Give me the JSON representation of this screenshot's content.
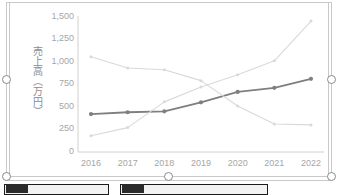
{
  "chart_data": {
    "type": "line",
    "title": "",
    "xlabel": "",
    "ylabel": "売上高（万円）",
    "categories": [
      "2016",
      "2017",
      "2018",
      "2019",
      "2020",
      "2021",
      "2022"
    ],
    "ylim": [
      0,
      1500
    ],
    "yticks": [
      0,
      250,
      500,
      750,
      1000,
      1250,
      1500
    ],
    "ytick_labels": [
      "0",
      "250",
      "500",
      "750",
      "1,000",
      "1,250",
      "1,500"
    ],
    "grid": false,
    "legend_position": "none",
    "series": [
      {
        "name": "series-dark",
        "color": "#7f7f7f",
        "marker": "circle",
        "values": [
          420,
          440,
          450,
          550,
          665,
          710,
          810
        ]
      },
      {
        "name": "series-light-rising",
        "color": "#d9d9d9",
        "marker": "circle",
        "values": [
          180,
          270,
          555,
          720,
          855,
          1010,
          1450
        ]
      },
      {
        "name": "series-light-declining",
        "color": "#d9d9d9",
        "marker": "circle",
        "values": [
          1055,
          930,
          910,
          790,
          510,
          310,
          300
        ]
      }
    ]
  },
  "selection": {
    "handles": [
      "left-middle",
      "right-middle",
      "bottom-left",
      "bottom-center",
      "bottom-right"
    ]
  },
  "bottom_bar": {
    "items": [
      "",
      ""
    ]
  }
}
